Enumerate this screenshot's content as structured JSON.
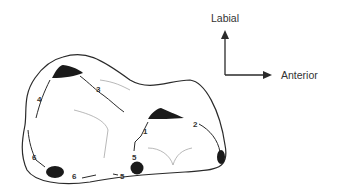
{
  "diagram": {
    "orientation": {
      "vertical_label": "Labial",
      "horizontal_label": "Anterior"
    },
    "numbers": [
      {
        "id": "n1",
        "text": "1",
        "x": 143,
        "y": 134
      },
      {
        "id": "n2",
        "text": "2",
        "x": 195,
        "y": 126
      },
      {
        "id": "n3",
        "text": "3",
        "x": 97,
        "y": 91
      },
      {
        "id": "n4",
        "text": "4",
        "x": 38,
        "y": 101
      },
      {
        "id": "n5a",
        "text": "5",
        "x": 133,
        "y": 159
      },
      {
        "id": "n5b",
        "text": "5",
        "x": 121,
        "y": 179
      },
      {
        "id": "n6a",
        "text": "6",
        "x": 33,
        "y": 159
      },
      {
        "id": "n6b",
        "text": "6",
        "x": 73,
        "y": 178
      }
    ],
    "colors": {
      "outline": "#2a2a2a",
      "fill": "#1a1a1a",
      "faint": "#9a9a9a"
    }
  }
}
